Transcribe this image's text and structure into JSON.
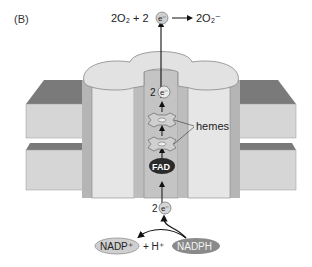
{
  "figure": {
    "panel_label": "(B)",
    "reaction_top": {
      "lhs": "2O₂ + 2",
      "electron": "e⁻",
      "arrow": "→",
      "rhs": "2O₂⁻"
    },
    "channel": {
      "electron_top_coeff": "2",
      "electron_top": "e⁻",
      "hemes_label": "hemes",
      "fad_label": "FAD",
      "electron_bottom_coeff": "2",
      "electron_bottom": "e⁻"
    },
    "reaction_bottom": {
      "nadp_plus": "NADP⁺",
      "plus_h": "+ H⁺",
      "nadph": "NADPH"
    },
    "colors": {
      "membrane_top": "#7a7a7a",
      "membrane_face": "#d6d6d6",
      "protein_light": "#e2e2e2",
      "protein_side": "#b5b5b5",
      "channel": "#c4c4c4",
      "fad": "#2a2a2a",
      "nadph": "#8a8a8a",
      "nadp": "#cfcfcf"
    }
  }
}
